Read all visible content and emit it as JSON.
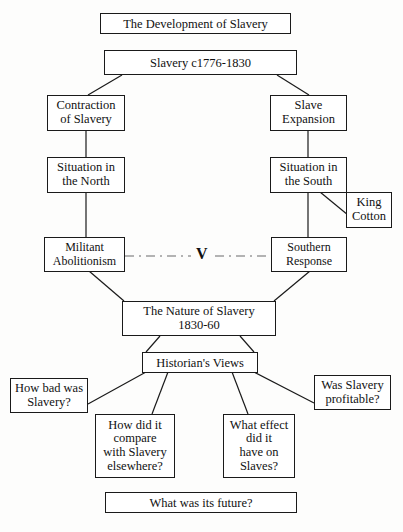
{
  "diagram": {
    "title": "The Development of Slavery",
    "background_color": "#fdfdfc",
    "line_color": "#1a1a1a",
    "dashed_link_color": "#6b6b6b",
    "nodes": {
      "title_box": "The Development of Slavery",
      "slavery_period": "Slavery c1776-1830",
      "contraction": "Contraction\nof Slavery",
      "slave_expansion": "Slave\nExpansion",
      "situation_north": "Situation in\nthe North",
      "situation_south": "Situation in\nthe South",
      "king_cotton": "King\nCotton",
      "militant_abolitionism": "Militant\nAbolitionism",
      "southern_response": "Southern\nResponse",
      "versus_marker": "V",
      "nature_of_slavery": "The Nature of Slavery\n1830-60",
      "historians_views": "Historian's Views",
      "q_how_bad": "How bad  was\nSlavery?",
      "q_compare": "How  did it\ncompare\nwith Slavery\nelsewhere?",
      "q_effect": "What effect\ndid it\nhave on\nSlaves?",
      "q_profitable": "Was Slavery\nprofitable?",
      "q_future": "What was its future?"
    }
  }
}
